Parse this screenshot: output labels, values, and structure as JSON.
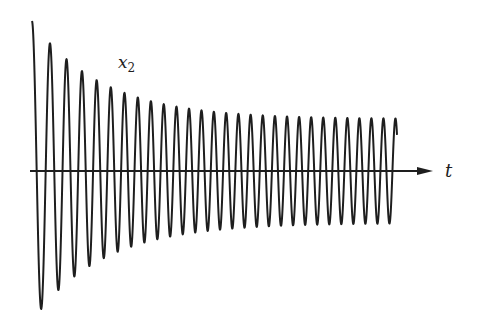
{
  "chart_data": {
    "type": "line",
    "title": "",
    "xlabel": "t",
    "ylabel": "",
    "series": [
      {
        "name": "x2",
        "description": "Damped oscillation decaying to a steady-state amplitude",
        "peaks": [
          1.0,
          0.88,
          0.79,
          0.72,
          0.67,
          0.62,
          0.59,
          0.57,
          0.55,
          0.54,
          0.53,
          0.52,
          0.52,
          0.51,
          0.51,
          0.51,
          0.5,
          0.5,
          0.5,
          0.5,
          0.5,
          0.5,
          0.5,
          0.5,
          0.5,
          0.5,
          0.5,
          0.5,
          0.5,
          0.5,
          0.5
        ],
        "initial_amplitude": 1.0,
        "steady_amplitude": 0.5,
        "cycles": 30.5
      }
    ],
    "grid": false,
    "legend": "none",
    "annotations": [
      {
        "text": "x2",
        "position": "above-left",
        "meaning": "series label"
      }
    ]
  },
  "labels": {
    "series_main": "x",
    "series_sub": "2",
    "x_axis": "t"
  },
  "style": {
    "ink_color": "#1e1e1e",
    "background": "#ffffff"
  },
  "geometry": {
    "axis_y": 171,
    "axis_x_start": 30,
    "axis_x_end": 433,
    "signal_x_start": 32,
    "signal_x_end": 397,
    "initial_amp_px": 150,
    "steady_amp_px": 52,
    "decay_px": 70,
    "period_start_px": 19,
    "period_end_px": 12
  }
}
